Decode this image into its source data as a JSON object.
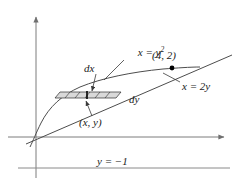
{
  "figure": {
    "type": "math-diagram",
    "axes": {
      "x_label": "x",
      "y_label": "y",
      "x_axis_pixel_y": 137,
      "y_axis_pixel_x": 36,
      "x_axis_from_px": 8,
      "x_axis_to_px": 228,
      "y_axis_from_px": 14,
      "y_axis_to_px": 178,
      "arrowheads": [
        "x-positive",
        "y-positive"
      ]
    },
    "labels": {
      "parabola": "x = y",
      "parabola_exponent": "2",
      "line": "x = 2y",
      "point": "(4, 2)",
      "dx": "dx",
      "dy": "dy",
      "point_xy": "(x, y)",
      "bottom_line": "y = −1"
    },
    "curves": [
      {
        "name": "parabola",
        "equation": "x = y^2",
        "label": "x = y2"
      },
      {
        "name": "line",
        "equation": "x = 2y",
        "label": "x = 2y"
      },
      {
        "name": "axis-of-rotation",
        "equation": "y = -1",
        "label": "y = −1"
      }
    ],
    "marked_points": [
      {
        "label": "(4, 2)",
        "x": 4,
        "y": 2
      },
      {
        "label": "(x, y)",
        "x": null,
        "y": null
      }
    ],
    "strip": {
      "orientation": "horizontal",
      "thickness_label": "dy",
      "width_label": "dx",
      "divisions": 6,
      "shaded": true
    }
  }
}
